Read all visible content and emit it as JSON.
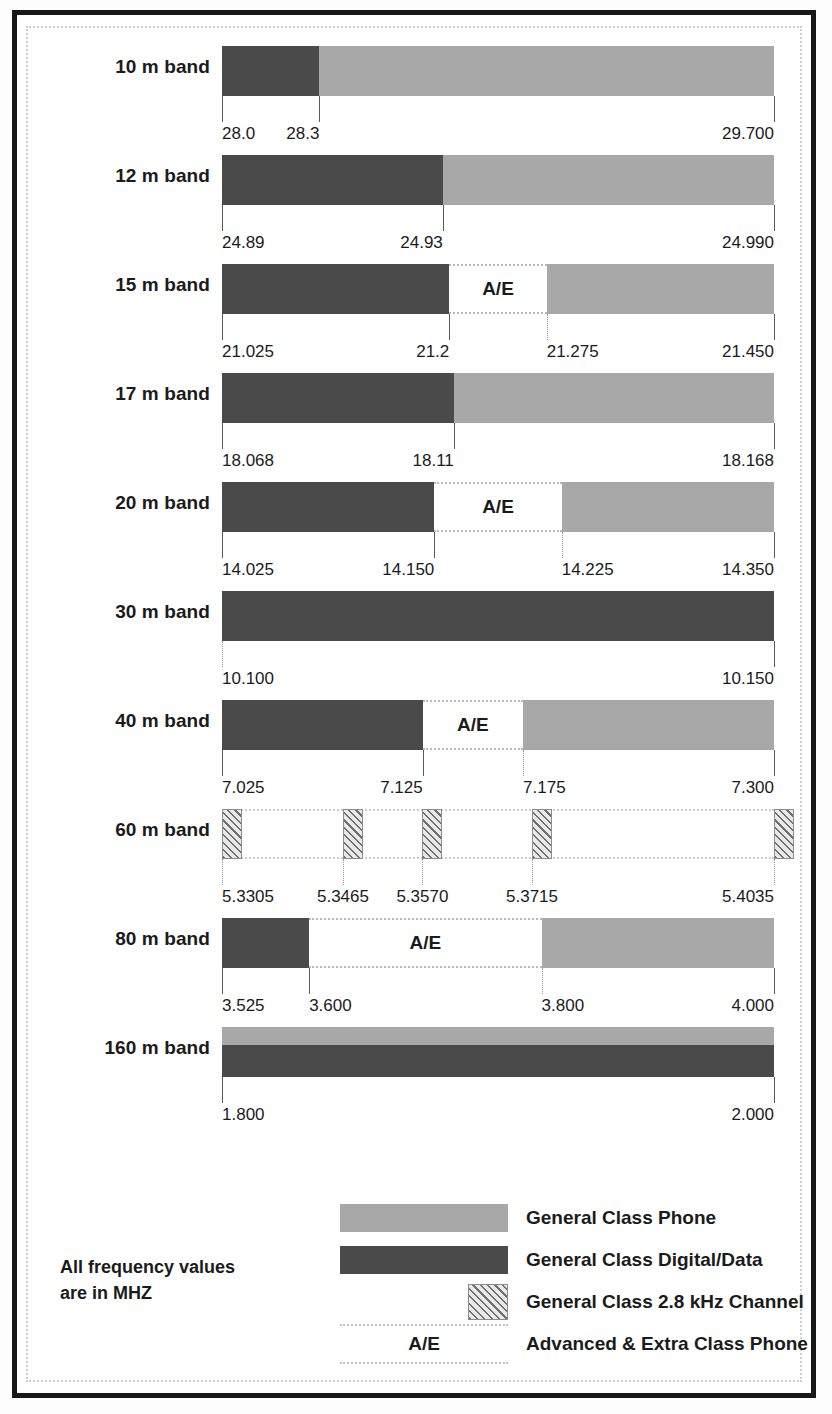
{
  "note": {
    "line1": "All frequency values",
    "line2": "are in MHZ"
  },
  "ae_text": "A/E",
  "colors": {
    "general_phone": "#a8a8a8",
    "general_digital": "#4a4a4a",
    "frame": "#181818",
    "text": "#1b1b1b"
  },
  "legend": {
    "items": [
      {
        "id": "general-class-phone",
        "label": "General Class Phone",
        "swatch": "light"
      },
      {
        "id": "general-class-digital",
        "label": "General Class Digital/Data",
        "swatch": "dark"
      },
      {
        "id": "general-class-channel",
        "label": "General Class 2.8 kHz Channel",
        "swatch": "hatch"
      },
      {
        "id": "advanced-extra-phone",
        "label": "Advanced & Extra Class Phone",
        "swatch": "ae",
        "swatch_text": "A/E"
      }
    ]
  },
  "bands": [
    {
      "id": "10m",
      "label": "10 m band",
      "start": 28.0,
      "end": 29.7,
      "segments": [
        {
          "type": "dark",
          "from": 28.0,
          "to": 28.3
        },
        {
          "type": "light",
          "from": 28.3,
          "to": 29.7
        }
      ],
      "ticks": [
        {
          "value": 28.0,
          "text": "28.0",
          "align": "left"
        },
        {
          "value": 28.3,
          "text": "28.3",
          "align": "right"
        },
        {
          "value": 29.7,
          "text": "29.700",
          "align": "right"
        }
      ]
    },
    {
      "id": "12m",
      "label": "12 m band",
      "start": 24.89,
      "end": 24.99,
      "segments": [
        {
          "type": "dark",
          "from": 24.89,
          "to": 24.93
        },
        {
          "type": "light",
          "from": 24.93,
          "to": 24.99
        }
      ],
      "ticks": [
        {
          "value": 24.89,
          "text": "24.89",
          "align": "left"
        },
        {
          "value": 24.93,
          "text": "24.93",
          "align": "right"
        },
        {
          "value": 24.99,
          "text": "24.990",
          "align": "right"
        }
      ]
    },
    {
      "id": "15m",
      "label": "15 m band",
      "start": 21.025,
      "end": 21.45,
      "segments": [
        {
          "type": "dark",
          "from": 21.025,
          "to": 21.2
        },
        {
          "type": "ae",
          "from": 21.2,
          "to": 21.275
        },
        {
          "type": "light",
          "from": 21.275,
          "to": 21.45
        }
      ],
      "ticks": [
        {
          "value": 21.025,
          "text": "21.025",
          "align": "left"
        },
        {
          "value": 21.2,
          "text": "21.2",
          "align": "right"
        },
        {
          "value": 21.275,
          "text": "21.275",
          "align": "left",
          "dotted": true
        },
        {
          "value": 21.45,
          "text": "21.450",
          "align": "right"
        }
      ]
    },
    {
      "id": "17m",
      "label": "17 m band",
      "start": 18.068,
      "end": 18.168,
      "segments": [
        {
          "type": "dark",
          "from": 18.068,
          "to": 18.11
        },
        {
          "type": "light",
          "from": 18.11,
          "to": 18.168
        }
      ],
      "ticks": [
        {
          "value": 18.068,
          "text": "18.068",
          "align": "left"
        },
        {
          "value": 18.11,
          "text": "18.11",
          "align": "right"
        },
        {
          "value": 18.168,
          "text": "18.168",
          "align": "right"
        }
      ]
    },
    {
      "id": "20m",
      "label": "20 m band",
      "start": 14.025,
      "end": 14.35,
      "segments": [
        {
          "type": "dark",
          "from": 14.025,
          "to": 14.15
        },
        {
          "type": "ae",
          "from": 14.15,
          "to": 14.225
        },
        {
          "type": "light",
          "from": 14.225,
          "to": 14.35
        }
      ],
      "ticks": [
        {
          "value": 14.025,
          "text": "14.025",
          "align": "left"
        },
        {
          "value": 14.15,
          "text": "14.150",
          "align": "right"
        },
        {
          "value": 14.225,
          "text": "14.225",
          "align": "left",
          "dotted": true
        },
        {
          "value": 14.35,
          "text": "14.350",
          "align": "right"
        }
      ]
    },
    {
      "id": "30m",
      "label": "30 m band",
      "start": 10.1,
      "end": 10.15,
      "segments": [
        {
          "type": "dark",
          "from": 10.1,
          "to": 10.15
        }
      ],
      "ticks": [
        {
          "value": 10.1,
          "text": "10.100",
          "align": "left",
          "dotted": true
        },
        {
          "value": 10.15,
          "text": "10.150",
          "align": "right"
        }
      ]
    },
    {
      "id": "40m",
      "label": "40 m band",
      "start": 7.025,
      "end": 7.3,
      "segments": [
        {
          "type": "dark",
          "from": 7.025,
          "to": 7.125
        },
        {
          "type": "ae",
          "from": 7.125,
          "to": 7.175
        },
        {
          "type": "light",
          "from": 7.175,
          "to": 7.3
        }
      ],
      "ticks": [
        {
          "value": 7.025,
          "text": "7.025",
          "align": "left"
        },
        {
          "value": 7.125,
          "text": "7.125",
          "align": "right"
        },
        {
          "value": 7.175,
          "text": "7.175",
          "align": "left",
          "dotted": true
        },
        {
          "value": 7.3,
          "text": "7.300",
          "align": "right"
        }
      ]
    },
    {
      "id": "60m",
      "label": "60 m band",
      "start": 5.3305,
      "end": 5.4035,
      "channels": [
        {
          "from": 5.3305,
          "to": 5.333
        },
        {
          "from": 5.3465,
          "to": 5.349
        },
        {
          "from": 5.357,
          "to": 5.3595
        },
        {
          "from": 5.3715,
          "to": 5.374
        },
        {
          "from": 5.4035,
          "to": 5.406
        }
      ],
      "ticks": [
        {
          "value": 5.3305,
          "text": "5.3305",
          "align": "left",
          "dotted": true
        },
        {
          "value": 5.3465,
          "text": "5.3465",
          "align": "center",
          "dotted": true
        },
        {
          "value": 5.357,
          "text": "5.3570",
          "align": "center",
          "dotted": true
        },
        {
          "value": 5.3715,
          "text": "5.3715",
          "align": "center",
          "dotted": true
        },
        {
          "value": 5.4035,
          "text": "5.4035",
          "align": "right",
          "dotted": true
        }
      ]
    },
    {
      "id": "80m",
      "label": "80 m band",
      "start": 3.525,
      "end": 4.0,
      "segments": [
        {
          "type": "dark",
          "from": 3.525,
          "to": 3.6
        },
        {
          "type": "ae",
          "from": 3.6,
          "to": 3.8
        },
        {
          "type": "light",
          "from": 3.8,
          "to": 4.0
        }
      ],
      "ticks": [
        {
          "value": 3.525,
          "text": "3.525",
          "align": "left"
        },
        {
          "value": 3.6,
          "text": "3.600",
          "align": "left"
        },
        {
          "value": 3.8,
          "text": "3.800",
          "align": "left",
          "dotted": true
        },
        {
          "value": 4.0,
          "text": "4.000",
          "align": "right"
        }
      ]
    },
    {
      "id": "160m",
      "label": "160 m band",
      "start": 1.8,
      "end": 2.0,
      "segments": [
        {
          "type": "split",
          "from": 1.8,
          "to": 2.0
        }
      ],
      "ticks": [
        {
          "value": 1.8,
          "text": "1.800",
          "align": "left"
        },
        {
          "value": 2.0,
          "text": "2.000",
          "align": "right"
        }
      ]
    }
  ]
}
